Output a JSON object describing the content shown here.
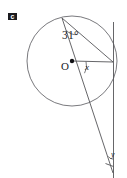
{
  "figure": {
    "part_label": "c",
    "labels": {
      "inscribed_angle": "31°",
      "center": "O",
      "central_angle": "x",
      "exterior_angle": "y"
    },
    "colors": {
      "stroke": "#555558",
      "circle_stroke": "#6a6a6e",
      "text": "#1b1b1f",
      "background": "#ffffff",
      "marker_fill": "#1a1a1e"
    },
    "geometry": {
      "circle": {
        "cx": 72,
        "cy": 61,
        "r": 45
      },
      "center_point": {
        "x": 72,
        "y": 61
      },
      "apex_point": {
        "x": 62,
        "y": 18
      },
      "tangent_point": {
        "x": 113,
        "y": 62
      },
      "vertical_line": {
        "x": 113.5,
        "y_top": 22,
        "y_bottom": 178
      },
      "secant_end": {
        "x": 113,
        "y": 173
      },
      "chord_apex_to_tangent": true,
      "radius_to_tangent": true,
      "right_angle_mark": {
        "x": 104,
        "y": 164,
        "size": 9
      }
    }
  }
}
